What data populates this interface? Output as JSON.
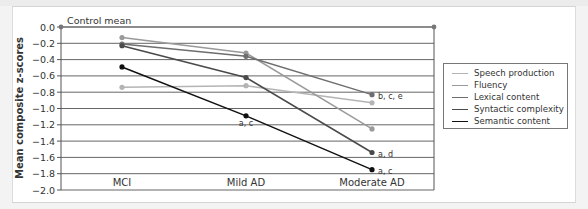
{
  "chart_data": {
    "type": "line",
    "title": "",
    "xlabel": "",
    "ylabel": "Mean composite z-scores",
    "ylim": [
      -2.0,
      0.0
    ],
    "yticks": [
      "0.0",
      "-0.2",
      "-0.4",
      "-0.6",
      "-0.8",
      "-1.0",
      "-1.2",
      "-1.4",
      "-1.6",
      "-1.8",
      "-2.0"
    ],
    "grid": true,
    "legend_position": "right",
    "categories": [
      "MCI",
      "Mild AD",
      "Moderate AD"
    ],
    "reference_line": {
      "label": "Control mean",
      "value": 0.0
    },
    "series": [
      {
        "name": "Speech production",
        "color": "#b4b4b4",
        "values": [
          -0.74,
          -0.72,
          -0.93
        ]
      },
      {
        "name": "Fluency",
        "color": "#9a9a9a",
        "values": [
          -0.13,
          -0.32,
          -1.25
        ]
      },
      {
        "name": "Lexical content",
        "color": "#6e6e6e",
        "values": [
          -0.21,
          -0.36,
          -0.83
        ]
      },
      {
        "name": "Syntactic complexity",
        "color": "#4a4a4a",
        "values": [
          -0.23,
          -0.62,
          -1.54
        ]
      },
      {
        "name": "Semantic content",
        "color": "#111111",
        "values": [
          -0.49,
          -1.09,
          -1.75
        ]
      }
    ],
    "annotations": [
      {
        "text": "a, c",
        "category": "Mild AD",
        "series": "Semantic content"
      },
      {
        "text": "b, c, e",
        "category": "Moderate AD",
        "series": "Lexical content"
      },
      {
        "text": "a, d",
        "category": "Moderate AD",
        "series": "Syntactic complexity"
      },
      {
        "text": "a, c",
        "category": "Moderate AD",
        "series": "Semantic content"
      }
    ]
  },
  "labels": {
    "control_mean": "Control mean",
    "ylabel": "Mean composite z-scores",
    "cat0": "MCI",
    "cat1": "Mild AD",
    "cat2": "Moderate AD",
    "ann_mild_semantic": "a, c",
    "ann_mod_lexical": "b, c, e",
    "ann_mod_syntactic": "a, d",
    "ann_mod_semantic": "a, c"
  },
  "legend": [
    {
      "label": "Speech production",
      "color": "#b4b4b4"
    },
    {
      "label": "Fluency",
      "color": "#9a9a9a"
    },
    {
      "label": "Lexical content",
      "color": "#6e6e6e"
    },
    {
      "label": "Syntactic complexity",
      "color": "#4a4a4a"
    },
    {
      "label": "Semantic content",
      "color": "#111111"
    }
  ]
}
